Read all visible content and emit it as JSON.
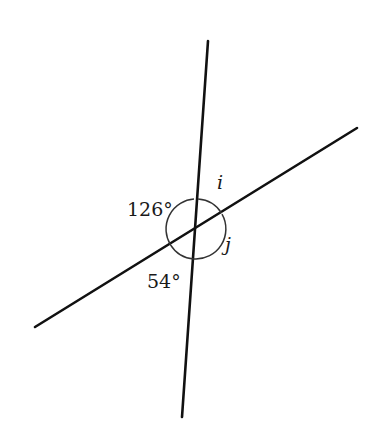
{
  "diagram": {
    "type": "intersecting-lines-angles",
    "lines": [
      {
        "id": "line-steep",
        "x1": 208,
        "y1": 41,
        "x2": 182,
        "y2": 417
      },
      {
        "id": "line-oblique",
        "x1": 357,
        "y1": 128,
        "x2": 35,
        "y2": 327
      }
    ],
    "intersection": {
      "x": 196,
      "y": 229
    },
    "arc_radius": 30,
    "angles": [
      {
        "id": "angle-126",
        "label": "126°",
        "position": "left"
      },
      {
        "id": "angle-i",
        "label": "i",
        "position": "top-right"
      },
      {
        "id": "angle-j",
        "label": "j",
        "position": "right"
      },
      {
        "id": "angle-54",
        "label": "54°",
        "position": "bottom-left"
      }
    ],
    "colors": {
      "line": "#111111",
      "arc": "#333333",
      "text": "#1a1a1a",
      "background": "#ffffff"
    }
  }
}
